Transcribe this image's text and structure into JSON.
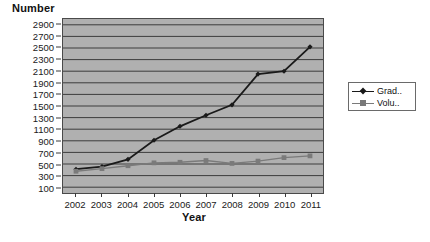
{
  "chart_data": {
    "type": "line",
    "title": "",
    "xlabel": "Year",
    "ylabel": "Number",
    "categories": [
      "2002",
      "2003",
      "2004",
      "2005",
      "2006",
      "2007",
      "2008",
      "2009",
      "2010",
      "2011"
    ],
    "x": [
      2002,
      2003,
      2004,
      2005,
      2006,
      2007,
      2008,
      2009,
      2010,
      2011
    ],
    "ylim": [
      0,
      3000
    ],
    "ytick_labels": [
      "2900",
      "2700",
      "2500",
      "2300",
      "2100",
      "1900",
      "1700",
      "1500",
      "1300",
      "1100",
      "900",
      "700",
      "500",
      "300",
      "100"
    ],
    "yticks": [
      2900,
      2700,
      2500,
      2300,
      2100,
      1900,
      1700,
      1500,
      1300,
      1100,
      900,
      700,
      500,
      300,
      100
    ],
    "grid": true,
    "legend_position": "right",
    "plot_background": "#b0b0b0",
    "series": [
      {
        "name": "Grad..",
        "color": "#1a1a1a",
        "marker": "diamond",
        "values": [
          410,
          455,
          580,
          910,
          1150,
          1340,
          1520,
          2050,
          2100,
          2520
        ]
      },
      {
        "name": "Volu..",
        "color": "#7a7a7a",
        "marker": "square",
        "values": [
          375,
          420,
          470,
          520,
          530,
          560,
          510,
          550,
          610,
          640
        ]
      }
    ]
  },
  "axes": {
    "y_title": "Number",
    "x_title": "Year"
  },
  "legend": {
    "entries": [
      {
        "label": "Grad..",
        "color": "#1a1a1a"
      },
      {
        "label": "Volu..",
        "color": "#7a7a7a"
      }
    ]
  }
}
